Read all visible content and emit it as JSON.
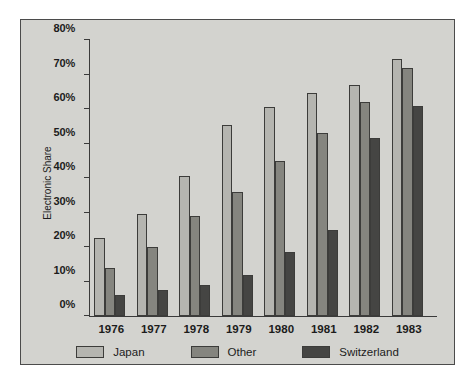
{
  "chart_data": {
    "type": "bar",
    "title": "",
    "subtitle": "",
    "xlabel": "",
    "ylabel": "Electronic Share",
    "categories": [
      "1976",
      "1977",
      "1978",
      "1979",
      "1980",
      "1981",
      "1982",
      "1983"
    ],
    "series": [
      {
        "name": "Japan",
        "color": "#b5b5b0",
        "values": [
          22.5,
          29.5,
          40.5,
          55.5,
          60.5,
          64.5,
          67.0,
          74.5
        ]
      },
      {
        "name": "Other",
        "color": "#85857f",
        "values": [
          14.0,
          20.0,
          29.0,
          36.0,
          45.0,
          53.0,
          62.0,
          72.0
        ]
      },
      {
        "name": "Switzerland",
        "color": "#454543",
        "values": [
          6.0,
          7.5,
          9.0,
          12.0,
          18.5,
          25.0,
          51.5,
          61.0
        ]
      }
    ],
    "ylim": [
      0,
      80
    ],
    "y_ticks": [
      0,
      10,
      20,
      30,
      40,
      50,
      60,
      70,
      80
    ],
    "y_tick_labels": [
      "0%",
      "10%",
      "20%",
      "30%",
      "40%",
      "50%",
      "60%",
      "70%",
      "80%"
    ],
    "grid": false,
    "legend_position": "bottom",
    "background_color": "#d3d3cf",
    "axis_color": "#3a3a3a",
    "bar_edge_color": "#3c3c3a"
  }
}
